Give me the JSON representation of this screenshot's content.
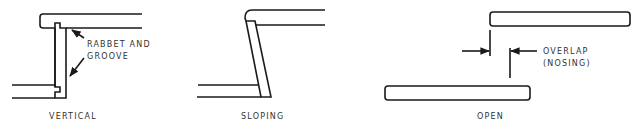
{
  "figure": {
    "panels": [
      {
        "id": "vertical",
        "caption": "VERTICAL",
        "annotation": [
          "RABBET AND",
          "GROOVE"
        ]
      },
      {
        "id": "sloping",
        "caption": "SLOPING"
      },
      {
        "id": "open",
        "caption": "OPEN",
        "annotation": [
          "OVERLAP",
          "(NOSING)"
        ]
      }
    ],
    "colors": {
      "line": "#1a1a1a",
      "text": "#333333",
      "background": "#ffffff"
    }
  }
}
